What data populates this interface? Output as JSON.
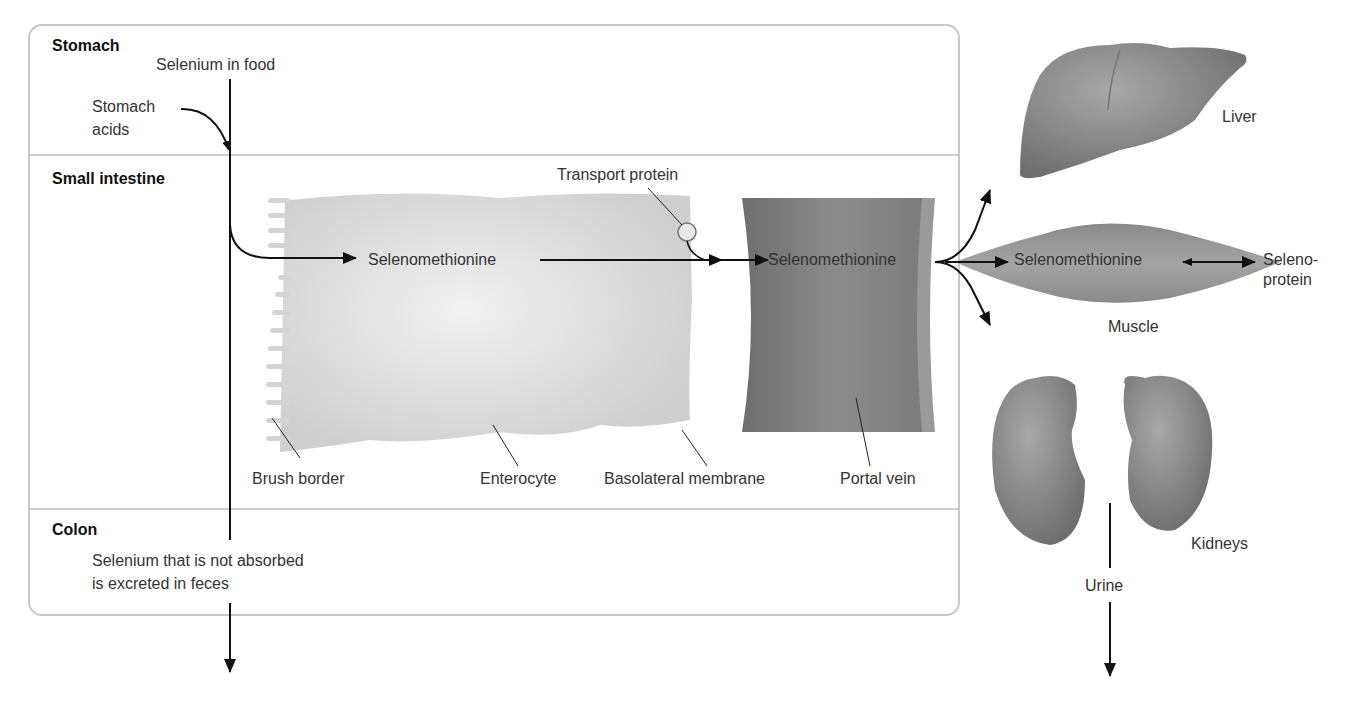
{
  "sections": {
    "stomach": "Stomach",
    "small_intestine": "Small intestine",
    "colon": "Colon"
  },
  "labels": {
    "selenium_in_food": "Selenium in food",
    "stomach_acids_line1": "Stomach",
    "stomach_acids_line2": "acids",
    "transport_protein": "Transport protein",
    "selenomethionine_enterocyte": "Selenomethionine",
    "selenomethionine_portal": "Selenomethionine",
    "selenomethionine_muscle": "Selenomethionine",
    "selenoprotein_line1": "Seleno-",
    "selenoprotein_line2": "protein",
    "brush_border": "Brush border",
    "enterocyte": "Enterocyte",
    "basolateral_membrane": "Basolateral membrane",
    "portal_vein": "Portal vein",
    "colon_note_line1": "Selenium that is not absorbed",
    "colon_note_line2": "is excreted in feces",
    "liver": "Liver",
    "muscle": "Muscle",
    "kidneys": "Kidneys",
    "urine": "Urine"
  },
  "colors": {
    "box_border": "#c8c8c8",
    "enterocyte_fill": "#d9d9d9",
    "portal_vein_fill": "#8a8a8a",
    "organ_fill": "#8f8f8f",
    "arrow": "#111111"
  }
}
